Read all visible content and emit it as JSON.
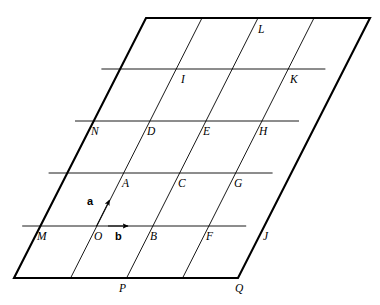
{
  "figure": {
    "kind": "two-dimensional-lattice-parallelogram",
    "background_color": "#ffffff",
    "stroke_color": "#000000",
    "outline_width": 2.1,
    "grid_width": 0.9,
    "vector_width": 1.0,
    "geometry": {
      "corner_top_left": [
        146,
        18
      ],
      "corner_top_right": [
        370,
        18
      ],
      "corner_bottom_right": [
        238,
        278
      ],
      "corner_bottom_left": [
        14,
        278
      ],
      "columns": 4,
      "rows": 5,
      "column_step_x": 56,
      "row_step_y": 52,
      "row_shear_x": -26.4,
      "row_y_values": [
        18,
        69,
        121,
        173,
        226,
        278
      ]
    },
    "outline": [
      [
        146,
        18
      ],
      [
        370,
        18
      ],
      [
        238,
        278
      ],
      [
        14,
        278
      ]
    ],
    "grid_lines_slanted": [
      {
        "name": "slant-1",
        "x1": 202,
        "y1": 18,
        "x2": 70.6,
        "y2": 278
      },
      {
        "name": "slant-2",
        "x1": 258,
        "y1": 18,
        "x2": 126.6,
        "y2": 278
      },
      {
        "name": "slant-3",
        "x1": 314,
        "y1": 18,
        "x2": 182.6,
        "y2": 278
      }
    ],
    "grid_lines_horizontal": [
      {
        "name": "row-1",
        "x1": 101.4,
        "y1": 69,
        "x2": 325.4,
        "y2": 69
      },
      {
        "name": "row-2",
        "x1": 75.0,
        "y1": 121,
        "x2": 299.0,
        "y2": 121
      },
      {
        "name": "row-3",
        "x1": 48.6,
        "y1": 173,
        "x2": 272.6,
        "y2": 173
      },
      {
        "name": "row-4",
        "x1": 22.2,
        "y1": 226,
        "x2": 246.2,
        "y2": 226
      }
    ],
    "vectors": [
      {
        "name": "vector-a",
        "label": "a",
        "x1": 96.5,
        "y1": 226,
        "x2": 109.5,
        "y2": 200,
        "label_x": 87,
        "label_y": 196
      },
      {
        "name": "vector-b",
        "label": "b",
        "x1": 108,
        "y1": 226,
        "x2": 128,
        "y2": 226,
        "label_x": 115,
        "label_y": 231
      }
    ],
    "points": [
      {
        "name": "L",
        "label": "L",
        "x": 258,
        "y": 24
      },
      {
        "name": "I",
        "label": "I",
        "x": 181,
        "y": 74
      },
      {
        "name": "K",
        "label": "K",
        "x": 290,
        "y": 74
      },
      {
        "name": "N",
        "label": "N",
        "x": 91,
        "y": 126
      },
      {
        "name": "D",
        "label": "D",
        "x": 147,
        "y": 126
      },
      {
        "name": "E",
        "label": "E",
        "x": 203,
        "y": 126
      },
      {
        "name": "H",
        "label": "H",
        "x": 259,
        "y": 126
      },
      {
        "name": "A",
        "label": "A",
        "x": 122,
        "y": 178
      },
      {
        "name": "C",
        "label": "C",
        "x": 178,
        "y": 178
      },
      {
        "name": "G",
        "label": "G",
        "x": 234,
        "y": 178
      },
      {
        "name": "M",
        "label": "M",
        "x": 37,
        "y": 231
      },
      {
        "name": "O",
        "label": "O",
        "x": 94,
        "y": 231
      },
      {
        "name": "B",
        "label": "B",
        "x": 150,
        "y": 231
      },
      {
        "name": "F",
        "label": "F",
        "x": 206,
        "y": 231
      },
      {
        "name": "J",
        "label": "J",
        "x": 263,
        "y": 231
      },
      {
        "name": "P",
        "label": "P",
        "x": 119,
        "y": 283
      },
      {
        "name": "Q",
        "label": "Q",
        "x": 235,
        "y": 283
      }
    ]
  }
}
